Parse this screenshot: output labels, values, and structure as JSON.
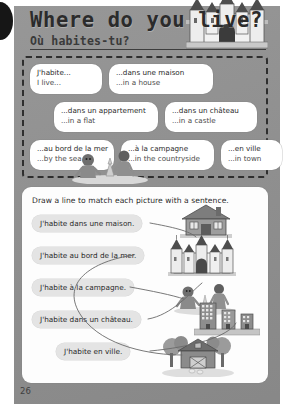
{
  "page": {
    "number": "26",
    "binding_hole": "binding-hole"
  },
  "header": {
    "title": "Where do you live?",
    "subtitle": "Où habites-tu?"
  },
  "vocabulary": {
    "rows": [
      [
        {
          "fr": "J'habite...",
          "en": "I live..."
        },
        {
          "fr": "...dans une maison",
          "en": "...in a house"
        }
      ],
      [
        {
          "fr": "...dans un appartement",
          "en": "...in a flat"
        },
        {
          "fr": "...dans un château",
          "en": "...in a castle"
        }
      ],
      [
        {
          "fr": "...au bord de la mer",
          "en": "...by the sea"
        },
        {
          "fr": "...à la campagne",
          "en": "...in the countryside"
        },
        {
          "fr": "...en ville",
          "en": "...in town"
        }
      ]
    ],
    "decorations": [
      "castle-illustration",
      "beach-children-illustration"
    ]
  },
  "exercise": {
    "instruction": "Draw a line to match each picture with a sentence.",
    "sentences": [
      "J'habite dans une maison.",
      "J'habite au bord de la mer.",
      "J'habite à la campagne.",
      "J'habite dans un château.",
      "J'habite en ville."
    ],
    "pictures": [
      "house-illustration",
      "castle-illustration",
      "beach-illustration",
      "city-buildings-illustration",
      "farm-countryside-illustration"
    ]
  },
  "colors": {
    "page_background": "#8f8f8f",
    "card_background": "#fdfdfd",
    "pill_background": "#e4e4e4",
    "ink": "#2b2b2b"
  }
}
